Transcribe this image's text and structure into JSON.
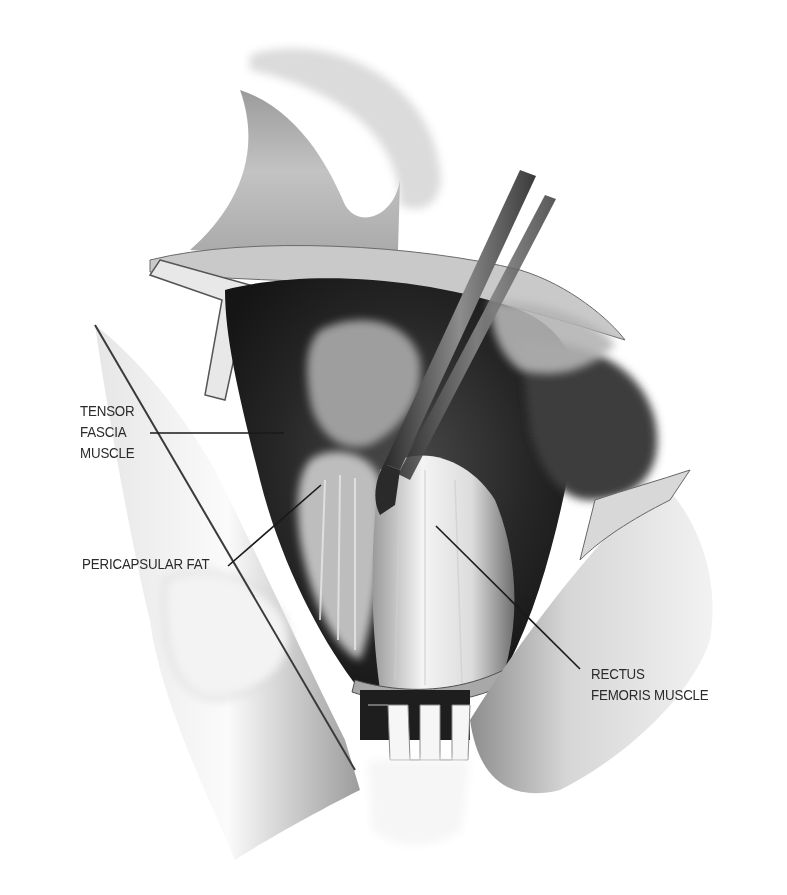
{
  "figure": {
    "style": "grayscale pencil illustration",
    "colors": {
      "background": "#ffffff",
      "label_text": "#2b2b2b",
      "leader_line": "#1a1a1a"
    }
  },
  "labels": [
    {
      "id": "tensor-fascia",
      "lines": [
        "TENSOR",
        "FASCIA",
        "MUSCLE"
      ],
      "leader": {
        "x1": 150,
        "y1": 433,
        "x2": 284,
        "y2": 433
      }
    },
    {
      "id": "pericapsular-fat",
      "lines": [
        "PERICAPSULAR FAT"
      ],
      "leader": {
        "x1": 228,
        "y1": 566,
        "x2": 321,
        "y2": 485
      }
    },
    {
      "id": "rectus-femoris",
      "lines": [
        "RECTUS",
        "FEMORIS MUSCLE"
      ],
      "leader": {
        "x1": 436,
        "y1": 526,
        "x2": 580,
        "y2": 669
      }
    }
  ]
}
